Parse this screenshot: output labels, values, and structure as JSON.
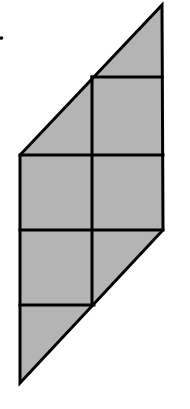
{
  "diagram": {
    "canvas": {
      "width": 190,
      "height": 409,
      "background": "#ffffff"
    },
    "colors": {
      "fill": "#b4b4b4",
      "stroke": "#000000"
    },
    "stroke_width": 3,
    "outline": {
      "points": "162,5 163,230 20,383 20,155"
    },
    "grid_lines": [
      {
        "name": "horizontal-line-1",
        "x1": 92,
        "y1": 77,
        "x2": 162,
        "y2": 77
      },
      {
        "name": "horizontal-line-2",
        "x1": 20,
        "y1": 155,
        "x2": 163,
        "y2": 155
      },
      {
        "name": "horizontal-line-3",
        "x1": 20,
        "y1": 230,
        "x2": 163,
        "y2": 230
      },
      {
        "name": "horizontal-line-4",
        "x1": 20,
        "y1": 305,
        "x2": 94,
        "y2": 305
      },
      {
        "name": "vertical-center-line",
        "x1": 92,
        "y1": 77,
        "x2": 92,
        "y2": 305
      }
    ],
    "dot": {
      "cx": 1.5,
      "cy": 38,
      "r": 1.8
    },
    "cells": {
      "top_triangles": 2,
      "full_squares": 4,
      "bottom_triangles": 2
    }
  }
}
